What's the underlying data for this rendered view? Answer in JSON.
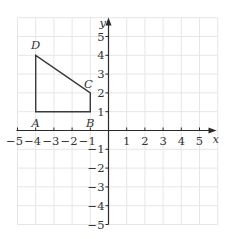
{
  "diagram": {
    "type": "coordinate-grid",
    "x_axis": {
      "label": "x",
      "min": -5,
      "max": 5,
      "ticks": [
        "−5",
        "−4",
        "−3",
        "−2",
        "−1",
        "1",
        "2",
        "3",
        "4",
        "5"
      ]
    },
    "y_axis": {
      "label": "y",
      "min": -5,
      "max": 5,
      "ticks": [
        "5",
        "4",
        "3",
        "2",
        "1",
        "−1",
        "−2",
        "−3",
        "−4",
        "−5"
      ]
    },
    "grid": {
      "x_from": -5,
      "x_to": 6,
      "y_from": -5,
      "y_to": 6,
      "color": "#e6e6e6"
    },
    "shape": {
      "name": "quadrilateral ABCD",
      "stroke": "#3a3a3a",
      "vertices": [
        {
          "label": "A",
          "x": -4,
          "y": 1
        },
        {
          "label": "B",
          "x": -1,
          "y": 1
        },
        {
          "label": "C",
          "x": -1,
          "y": 2
        },
        {
          "label": "D",
          "x": -4,
          "y": 4
        }
      ]
    }
  }
}
